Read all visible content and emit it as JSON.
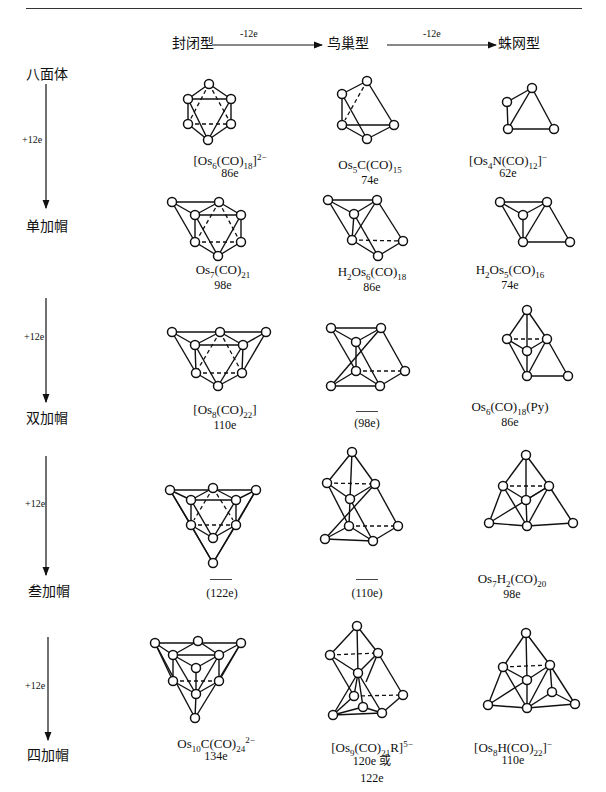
{
  "header": {
    "col_closo": "封闭型",
    "col_nido": "鸟巢型",
    "col_arachno": "蛛网型",
    "arrow1": "-12e",
    "arrow2": "-12e"
  },
  "rows": [
    {
      "label": "八面体",
      "step": "+12e",
      "closo": {
        "formula_html": "[Os<sub>6</sub>(CO)<sub>18</sub>]<sup>2−</sup>",
        "formula": "[Os6(CO)18]2−",
        "electrons": "86e"
      },
      "nido": {
        "formula_html": "Os<sub>5</sub>C(CO)<sub>15</sub>",
        "formula": "Os5C(CO)15",
        "electrons": "74e"
      },
      "arachno": {
        "formula_html": "[Os<sub>4</sub>N(CO)<sub>12</sub>]<sup>−</sup>",
        "formula": "[Os4N(CO)12]−",
        "electrons": "62e"
      }
    },
    {
      "label": "单加帽",
      "step": "+12e",
      "closo": {
        "formula_html": "Os<sub>7</sub>(CO)<sub>21</sub>",
        "formula": "Os7(CO)21",
        "electrons": "98e"
      },
      "nido": {
        "formula_html": "H<sub>2</sub>Os<sub>6</sub>(CO)<sub>18</sub>",
        "formula": "H2Os6(CO)18",
        "electrons": "86e"
      },
      "arachno": {
        "formula_html": "H<sub>2</sub>Os<sub>5</sub>(CO)<sub>16</sub>",
        "formula": "H2Os5(CO)16",
        "electrons": "74e"
      }
    },
    {
      "label": "双加帽",
      "step": "+12e",
      "closo": {
        "formula_html": "[Os<sub>8</sub>(CO)<sub>22</sub>]",
        "formula": "[Os8(CO)22]",
        "electrons": "110e"
      },
      "nido": {
        "formula_html": "",
        "formula": "",
        "electrons": "(98e)",
        "unknown": true
      },
      "arachno": {
        "formula_html": "Os<sub>6</sub>(CO)<sub>18</sub>(Py)",
        "formula": "Os6(CO)18(Py)",
        "electrons": "86e"
      }
    },
    {
      "label": "叁加帽",
      "step": "+12e",
      "closo": {
        "formula_html": "",
        "formula": "",
        "electrons": "(122e)",
        "unknown": true
      },
      "nido": {
        "formula_html": "",
        "formula": "",
        "electrons": "(110e)",
        "unknown": true
      },
      "arachno": {
        "formula_html": "Os<sub>7</sub>H<sub>2</sub>(CO)<sub>20</sub>",
        "formula": "Os7H2(CO)20",
        "electrons": "98e"
      }
    },
    {
      "label": "四加帽",
      "closo": {
        "formula_html": "Os<sub>10</sub>C(CO)<sub>24</sub><sup>2−</sup>",
        "formula": "Os10C(CO)24 2−",
        "electrons": "134e"
      },
      "nido": {
        "formula_html": "[Os<sub>9</sub>(CO)<sub>21</sub>R]<sup>5−</sup>",
        "formula": "[Os9(CO)21R]5−",
        "electrons": "120e 或",
        "electrons2": "122e"
      },
      "arachno": {
        "formula_html": "[Os<sub>8</sub>H(CO)<sub>22</sub>]<sup>−</sup>",
        "formula": "[Os8H(CO)22]−",
        "electrons": "110e"
      }
    }
  ]
}
